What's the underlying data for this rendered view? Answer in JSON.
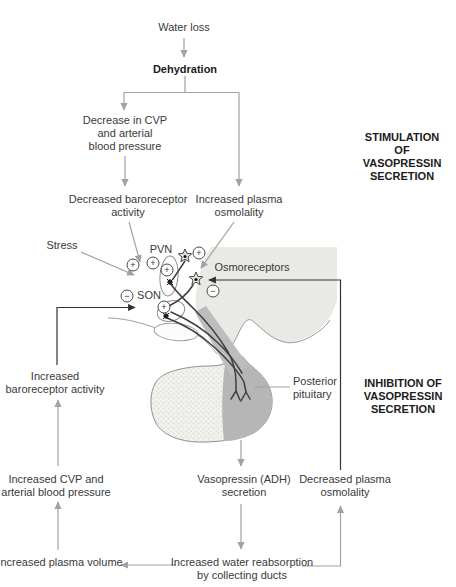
{
  "flowchart": {
    "water_loss": "Water loss",
    "dehydration": "Dehydration",
    "decrease_cvp": "Decrease in CVP\nand arterial\nblood pressure",
    "decreased_baroreceptor": "Decreased baroreceptor\nactivity",
    "increased_plasma_osmolality": "Increased plasma\nosmolality",
    "stress": "Stress",
    "increased_baroreceptor": "Increased\nbaroreceptor activity",
    "increased_cvp": "Increased CVP and\narterial blood pressure",
    "increased_plasma_volume": "Increased plasma volume",
    "vasopressin_secretion": "Vasopressin (ADH)\nsecretion",
    "decreased_plasma_osmolality": "Decreased plasma\nosmolality",
    "water_reabsorption": "Increased water reabsorption\nby collecting ducts"
  },
  "headings": {
    "stimulation": "STIMULATION OF\nVASOPRESSIN\nSECRETION",
    "inhibition": "INHIBITION OF\nVASOPRESSIN\nSECRETION"
  },
  "anatomy": {
    "pvn": "PVN",
    "son": "SON",
    "osmoreceptors": "Osmoreceptors",
    "posterior_pituitary": "Posterior\npituitary"
  },
  "symbols": {
    "plus": "+",
    "minus": "−"
  },
  "colors": {
    "arrow_gray": "#a2a2a2",
    "line_black": "#333333",
    "hypothalamus_region": "#e9e9e6",
    "posterior_lobe": "#b6b6b6",
    "anterior_lobe": "#f2f2ee",
    "outline": "#999999",
    "axon": "#3f3f3f"
  }
}
